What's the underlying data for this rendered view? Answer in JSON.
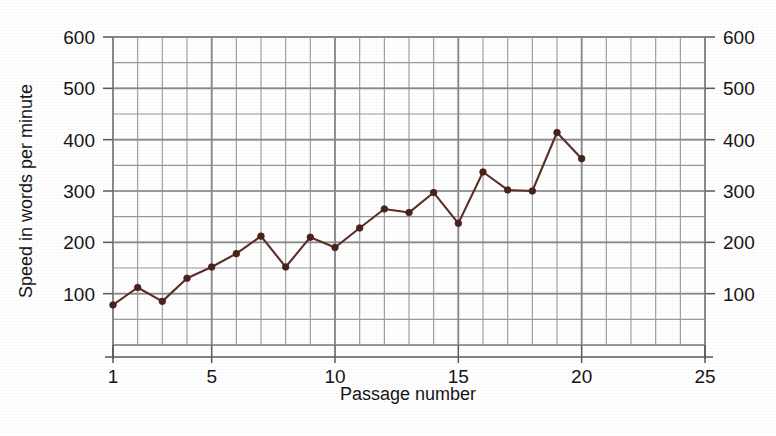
{
  "chart_data": {
    "type": "line",
    "title": "",
    "xlabel": "Passage number",
    "ylabel": "Speed in words per minute",
    "ylabel_right": "Speed in words per minute",
    "x": [
      1,
      2,
      3,
      4,
      5,
      6,
      7,
      8,
      9,
      10,
      11,
      12,
      13,
      14,
      15,
      16,
      17,
      18,
      19,
      20
    ],
    "values": [
      78,
      112,
      85,
      130,
      152,
      178,
      212,
      152,
      210,
      190,
      228,
      265,
      258,
      297,
      237,
      337,
      302,
      300,
      414,
      363
    ],
    "series": [
      {
        "name": "Reading speed",
        "values": [
          78,
          112,
          85,
          130,
          152,
          178,
          212,
          152,
          210,
          190,
          228,
          265,
          258,
          297,
          237,
          337,
          302,
          300,
          414,
          363
        ]
      }
    ],
    "xlim": [
      1,
      25
    ],
    "ylim": [
      0,
      600
    ],
    "xticks_major": [
      1,
      5,
      10,
      15,
      20,
      25
    ],
    "xtick_labels": [
      "1",
      "5",
      "10",
      "15",
      "20",
      "25"
    ],
    "yticks_major": [
      100,
      200,
      300,
      400,
      500,
      600
    ],
    "ytick_labels": [
      "100",
      "200",
      "300",
      "400",
      "500",
      "600"
    ],
    "yticks_right_labels": [
      "100",
      "200",
      "300",
      "400",
      "500",
      "600"
    ],
    "x_minor_step": 1,
    "y_minor_step": 50,
    "grid": true,
    "legend": "none",
    "marker": "circle",
    "colors": {
      "line": "#5c2f29",
      "marker": "#4a221d",
      "grid_major": "#8a8a8a",
      "grid_minor": "#9a9a9a",
      "axis": "#5a5a5a",
      "text": "#161616",
      "background": "#ffffff"
    }
  }
}
